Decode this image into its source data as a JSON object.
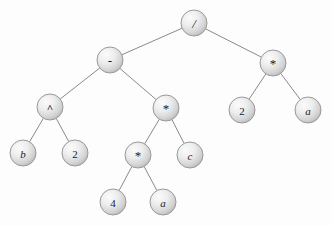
{
  "figure": {
    "kind": "expression-tree",
    "background_color": "#fdfdfd",
    "node_fill_light": "#f2f2f2",
    "node_fill_dark": "#bdbdbd",
    "node_stroke_color": "#9a9a9a",
    "edge_color": "#8a8a8a",
    "label_color": "#1a1a1a",
    "node_radius": 13
  },
  "nodes": [
    {
      "id": "n0",
      "label": "/",
      "x": 194,
      "y": 23,
      "style": "slash",
      "role": "root-operator"
    },
    {
      "id": "n1",
      "label": "-",
      "x": 110,
      "y": 60,
      "style": "minus",
      "role": "operator"
    },
    {
      "id": "n2",
      "label": "*",
      "x": 273,
      "y": 63,
      "style": "star",
      "role": "operator"
    },
    {
      "id": "n3",
      "label": "^",
      "x": 50,
      "y": 107,
      "style": "caret",
      "role": "operator"
    },
    {
      "id": "n4",
      "label": "*",
      "x": 166,
      "y": 108,
      "style": "star",
      "role": "operator"
    },
    {
      "id": "n5",
      "label": "2",
      "x": 242,
      "y": 110,
      "style": "number",
      "role": "leaf"
    },
    {
      "id": "n6",
      "label": "a",
      "x": 308,
      "y": 110,
      "style": "ident",
      "role": "leaf"
    },
    {
      "id": "n7",
      "label": "b",
      "x": 23,
      "y": 153,
      "style": "ident",
      "role": "leaf"
    },
    {
      "id": "n8",
      "label": "2",
      "x": 75,
      "y": 153,
      "style": "number",
      "role": "leaf"
    },
    {
      "id": "n9",
      "label": "*",
      "x": 138,
      "y": 155,
      "style": "star",
      "role": "operator"
    },
    {
      "id": "n10",
      "label": "c",
      "x": 190,
      "y": 155,
      "style": "ident",
      "role": "leaf"
    },
    {
      "id": "n11",
      "label": "4",
      "x": 113,
      "y": 202,
      "style": "number",
      "role": "leaf"
    },
    {
      "id": "n12",
      "label": "a",
      "x": 163,
      "y": 202,
      "style": "ident",
      "role": "leaf"
    }
  ],
  "edges": [
    {
      "from": "n0",
      "to": "n1"
    },
    {
      "from": "n0",
      "to": "n2"
    },
    {
      "from": "n1",
      "to": "n3"
    },
    {
      "from": "n1",
      "to": "n4"
    },
    {
      "from": "n2",
      "to": "n5"
    },
    {
      "from": "n2",
      "to": "n6"
    },
    {
      "from": "n3",
      "to": "n7"
    },
    {
      "from": "n3",
      "to": "n8"
    },
    {
      "from": "n4",
      "to": "n9"
    },
    {
      "from": "n4",
      "to": "n10"
    },
    {
      "from": "n9",
      "to": "n11"
    },
    {
      "from": "n9",
      "to": "n12"
    }
  ]
}
